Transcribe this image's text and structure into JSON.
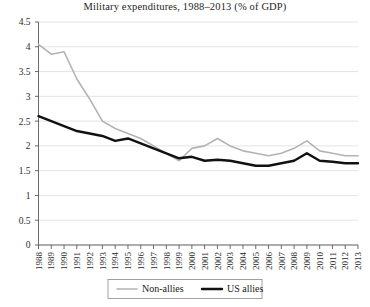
{
  "chart_data": {
    "type": "line",
    "title": "Military expenditures, 1988–2013 (% of GDP)",
    "xlabel": "",
    "ylabel": "",
    "ylim": [
      0,
      4.5
    ],
    "yticks": [
      "0",
      "0.5",
      "1",
      "1.5",
      "2",
      "2.5",
      "3",
      "3.5",
      "4",
      "4.5"
    ],
    "ytick_values": [
      0,
      0.5,
      1,
      1.5,
      2,
      2.5,
      3,
      3.5,
      4,
      4.5
    ],
    "grid": true,
    "legend_position": "bottom-center",
    "categories": [
      "1988",
      "1989",
      "1990",
      "1991",
      "1992",
      "1993",
      "1994",
      "1995",
      "1996",
      "1997",
      "1998",
      "1999",
      "2000",
      "2001",
      "2002",
      "2003",
      "2004",
      "2005",
      "2006",
      "2007",
      "2008",
      "2009",
      "2010",
      "2011",
      "2012",
      "2013"
    ],
    "x": [
      1988,
      1989,
      1990,
      1991,
      1992,
      1993,
      1994,
      1995,
      1996,
      1997,
      1998,
      1999,
      2000,
      2001,
      2002,
      2003,
      2004,
      2005,
      2006,
      2007,
      2008,
      2009,
      2010,
      2011,
      2012,
      2013
    ],
    "series": [
      {
        "name": "Non-allies",
        "color": "#b3b3b3",
        "width": 1.6,
        "values": [
          4.05,
          3.85,
          3.9,
          3.35,
          2.95,
          2.5,
          2.35,
          2.25,
          2.15,
          2.0,
          1.85,
          1.7,
          1.95,
          2.0,
          2.15,
          2.0,
          1.9,
          1.85,
          1.8,
          1.85,
          1.95,
          2.1,
          1.9,
          1.85,
          1.8,
          1.8
        ]
      },
      {
        "name": "US allies",
        "color": "#111111",
        "width": 2.4,
        "values": [
          2.6,
          2.5,
          2.4,
          2.3,
          2.25,
          2.2,
          2.1,
          2.15,
          2.05,
          1.95,
          1.85,
          1.75,
          1.78,
          1.7,
          1.72,
          1.7,
          1.65,
          1.6,
          1.6,
          1.65,
          1.7,
          1.85,
          1.7,
          1.68,
          1.65,
          1.65
        ]
      }
    ],
    "legend": [
      {
        "label": "Non-allies",
        "color": "#b3b3b3",
        "width": 1.6
      },
      {
        "label": "US allies",
        "color": "#111111",
        "width": 2.4
      }
    ]
  }
}
